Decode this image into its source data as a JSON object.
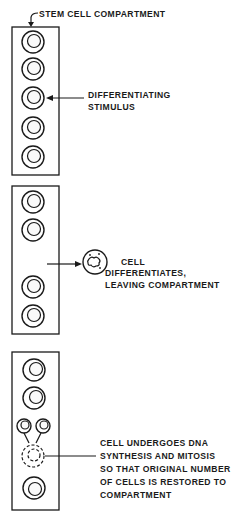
{
  "panels": [
    {
      "title": "STEM CELL COMPARTMENT",
      "annotation": [
        "DIFFERENTIATING",
        "STIMULUS"
      ],
      "cell_count": 5
    },
    {
      "annotation": [
        "CELL",
        "DIFFERENTIATES,",
        "LEAVING COMPARTMENT"
      ],
      "cell_count": 4
    },
    {
      "annotation": [
        "CELL UNDERGOES DNA",
        "SYNTHESIS AND MITOSIS",
        "SO THAT ORIGINAL NUMBER",
        "OF CELLS IS RESTORED TO",
        "COMPARTMENT"
      ],
      "cell_count": 3,
      "daughter_cells": 2
    }
  ],
  "colors": {
    "ink": "#1a1a1a",
    "paper": "#ffffff"
  }
}
